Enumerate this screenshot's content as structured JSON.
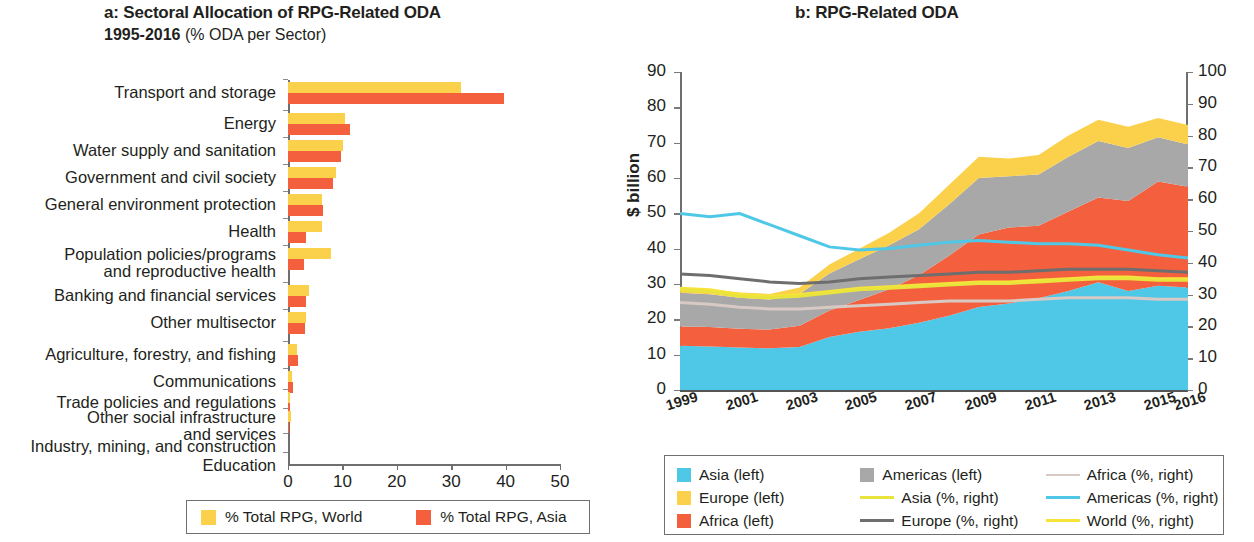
{
  "panel_a": {
    "title": "a: Sectoral Allocation of RPG-Related ODA",
    "subtitle_strong": "1995-2016",
    "subtitle_rest": " (% ODA per Sector)",
    "legend": [
      {
        "label": "% Total RPG, World",
        "color": "#fbd14b",
        "name": "world"
      },
      {
        "label": "% Total RPG, Asia",
        "color": "#f4603e",
        "name": "asia"
      }
    ],
    "chart_data": {
      "type": "bar",
      "orientation": "horizontal",
      "title": "a: Sectoral Allocation of RPG-Related ODA 1995-2016 (% ODA per Sector)",
      "xlabel": "",
      "ylabel": "",
      "xlim": [
        0,
        50
      ],
      "xticks": [
        0,
        10,
        20,
        30,
        40,
        50
      ],
      "grid": false,
      "legend_position": "bottom",
      "categories": [
        "Transport and storage",
        "Energy",
        "Water supply and sanitation",
        "Government and civil society",
        "General environment protection",
        "Health",
        "Population policies/programs\nand reproductive health",
        "Banking and financial services",
        "Other multisector",
        "Agriculture, forestry, and fishing",
        "Communications",
        "Trade policies and regulations",
        "Other social infrastructure\nand services",
        "Industry, mining,  and construction",
        "Education"
      ],
      "series": [
        {
          "name": "% Total RPG, World",
          "color": "#fbd14b",
          "values": [
            31.8,
            10.5,
            10.2,
            8.9,
            6.2,
            6.3,
            7.9,
            3.8,
            3.4,
            1.6,
            0.7,
            0.4,
            0.5,
            0.0,
            0.0
          ]
        },
        {
          "name": "% Total RPG, Asia",
          "color": "#f4603e",
          "values": [
            39.7,
            11.4,
            9.7,
            8.2,
            6.4,
            3.4,
            3.0,
            3.4,
            3.1,
            1.8,
            0.9,
            0.3,
            0.1,
            0.0,
            0.0
          ]
        }
      ]
    }
  },
  "panel_b": {
    "title": "b: RPG-Related ODA",
    "ytitle_left": "$ billion",
    "ytitle_right": "% of total ODA",
    "legend": [
      {
        "label": "Asia (left)",
        "kind": "swatch",
        "color": "#4fc8e8"
      },
      {
        "label": "Americas (left)",
        "kind": "swatch",
        "color": "#a8a8a8"
      },
      {
        "label": "Africa (%, right)",
        "kind": "line",
        "color": "#d8c9c4"
      },
      {
        "label": "Europe (left)",
        "kind": "swatch",
        "color": "#fbd14b"
      },
      {
        "label": "Asia (%, right)",
        "kind": "line",
        "color": "#e8e43c"
      },
      {
        "label": "Americas (%, right)",
        "kind": "line",
        "color": "#4fc8e8"
      },
      {
        "label": "Africa (left)",
        "kind": "swatch",
        "color": "#f4603e"
      },
      {
        "label": "Europe (%, right)",
        "kind": "line",
        "color": "#6e6e6e"
      },
      {
        "label": "World (%, right)",
        "kind": "line",
        "color": "#f6e43a"
      }
    ],
    "chart_data": {
      "type": "area",
      "stacked": true,
      "title": "b: RPG-Related ODA",
      "xlabel": "",
      "ylabel": "$ billion",
      "y2label": "% of total ODA",
      "ylim": [
        0,
        90
      ],
      "yticks": [
        0,
        10,
        20,
        30,
        40,
        50,
        60,
        70,
        80,
        90
      ],
      "y2lim": [
        0,
        100
      ],
      "y2ticks": [
        0,
        10,
        20,
        30,
        40,
        50,
        60,
        70,
        80,
        90,
        100
      ],
      "grid": false,
      "legend_position": "bottom",
      "x": [
        1999,
        2000,
        2001,
        2002,
        2003,
        2004,
        2005,
        2006,
        2007,
        2008,
        2009,
        2010,
        2011,
        2012,
        2013,
        2014,
        2015,
        2016
      ],
      "xtick_labels": [
        "1999",
        "2001",
        "2003",
        "2005",
        "2007",
        "2009",
        "2011",
        "2013",
        "2015",
        "2016"
      ],
      "xtick_values": [
        1999,
        2001,
        2003,
        2005,
        2007,
        2009,
        2011,
        2013,
        2015,
        2016
      ],
      "areas": [
        {
          "name": "Asia (left)",
          "color": "#4fc8e8",
          "axis": "left",
          "values": [
            12.5,
            12.3,
            12.0,
            11.8,
            12.2,
            15.0,
            16.5,
            17.5,
            19.0,
            21.0,
            23.5,
            24.5,
            26.0,
            28.0,
            30.5,
            28.0,
            29.5,
            29.0
          ]
        },
        {
          "name": "Africa (left)",
          "color": "#f4603e",
          "axis": "left",
          "values": [
            5.5,
            5.5,
            5.3,
            5.3,
            6.0,
            7.5,
            9.0,
            11.0,
            13.5,
            17.0,
            20.5,
            21.5,
            20.5,
            22.5,
            24.0,
            25.5,
            29.5,
            28.5
          ]
        },
        {
          "name": "Americas (left)",
          "color": "#a8a8a8",
          "axis": "left",
          "values": [
            9.5,
            9.3,
            8.8,
            8.5,
            9.0,
            10.5,
            11.5,
            12.5,
            13.0,
            14.5,
            16.0,
            14.5,
            14.5,
            15.5,
            16.0,
            15.0,
            12.5,
            12.0
          ]
        },
        {
          "name": "Europe (left)",
          "color": "#fbd14b",
          "axis": "left",
          "values": [
            1.5,
            1.5,
            1.5,
            1.6,
            1.8,
            2.5,
            3.0,
            3.5,
            4.5,
            5.5,
            6.0,
            5.0,
            5.5,
            6.0,
            6.0,
            6.0,
            5.5,
            5.5
          ]
        }
      ],
      "lines": [
        {
          "name": "Americas (%, right)",
          "color": "#4fc8e8",
          "axis": "right",
          "values": [
            55.5,
            54.5,
            55.5,
            52.0,
            48.5,
            45.0,
            44.0,
            44.5,
            45.5,
            46.5,
            47.0,
            46.5,
            46.0,
            46.0,
            45.5,
            44.0,
            42.5,
            41.5
          ]
        },
        {
          "name": "Europe (%, right)",
          "color": "#6e6e6e",
          "axis": "right",
          "values": [
            36.5,
            36.0,
            35.0,
            34.0,
            33.5,
            34.0,
            35.0,
            35.5,
            36.0,
            36.5,
            37.0,
            37.0,
            37.5,
            38.0,
            38.0,
            38.0,
            37.5,
            37.0
          ]
        },
        {
          "name": "World (%, right)",
          "color": "#f6e43a",
          "axis": "right",
          "values": [
            32.0,
            31.5,
            30.0,
            29.5,
            30.0,
            31.0,
            32.0,
            32.5,
            33.0,
            33.5,
            34.0,
            34.0,
            34.5,
            35.0,
            35.5,
            35.5,
            35.0,
            35.0
          ]
        },
        {
          "name": "Asia (%, right)",
          "color": "#e8e43c",
          "axis": "right",
          "values": [
            31.5,
            31.0,
            29.5,
            29.0,
            29.5,
            30.5,
            31.5,
            32.0,
            32.5,
            33.0,
            33.5,
            33.5,
            34.0,
            34.5,
            35.0,
            35.0,
            34.5,
            34.5
          ]
        },
        {
          "name": "Africa (%, right)",
          "color": "#d8c9c4",
          "axis": "right",
          "values": [
            27.5,
            27.0,
            26.0,
            25.5,
            25.5,
            26.0,
            26.5,
            27.0,
            27.5,
            28.0,
            28.0,
            28.0,
            28.5,
            29.0,
            29.0,
            29.0,
            28.5,
            28.5
          ]
        }
      ]
    }
  }
}
